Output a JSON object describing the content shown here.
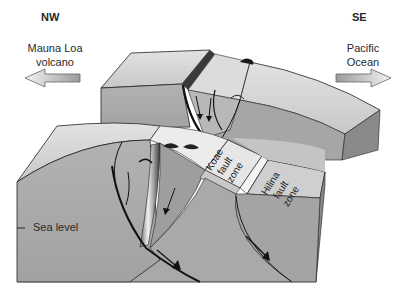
{
  "figure": {
    "type": "block-diagram"
  },
  "directions": {
    "left": {
      "label": "NW",
      "place_line1": "Mauna Loa",
      "place_line2": "volcano",
      "arrow": "left-arrow"
    },
    "right": {
      "label": "SE",
      "place_line1": "Pacific",
      "place_line2": "Ocean",
      "arrow": "right-arrow"
    }
  },
  "annotations": {
    "sea_level": "Sea level",
    "koae": {
      "line1": "Koae",
      "line2": "fault",
      "line3": "zone"
    },
    "hilina": {
      "line1": "Hilina",
      "line2": "fault",
      "line3": "zone"
    }
  },
  "colors": {
    "top_face": "#d6d6d6",
    "front_face": "#a8a8a8",
    "side_face": "#8a8a8a",
    "fault_zone_face": "#e8e8e8",
    "outline": "#1a1a1a"
  }
}
